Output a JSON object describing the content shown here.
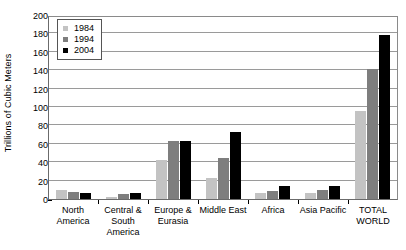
{
  "chart_data": {
    "type": "bar",
    "title": "",
    "xlabel": "",
    "ylabel": "Trillions of Cubic Meters",
    "ylim": [
      0,
      200
    ],
    "yticks": [
      0,
      20,
      40,
      60,
      80,
      100,
      120,
      140,
      160,
      180,
      200
    ],
    "grid": true,
    "legend_position": "top-left",
    "categories": [
      "North America",
      "Central & South America",
      "Europe & Eurasia",
      "Middle East",
      "Africa",
      "Asia Pacific",
      "TOTAL WORLD"
    ],
    "series": [
      {
        "name": "1984",
        "color": "#c3c3c3",
        "values": [
          10,
          2.5,
          42,
          23,
          6,
          6,
          96
        ]
      },
      {
        "name": "1994",
        "color": "#7e7e7e",
        "values": [
          8,
          5,
          63,
          45,
          9,
          10,
          141
        ]
      },
      {
        "name": "2004",
        "color": "#000000",
        "values": [
          7,
          6.5,
          63,
          73,
          14,
          14,
          178
        ]
      }
    ]
  },
  "axis": {
    "y_title": "Trillions of Cubic Meters",
    "y_labels": [
      "200",
      "180",
      "160",
      "140",
      "120",
      "100",
      "80",
      "60",
      "40",
      "20",
      "0"
    ],
    "x_labels": [
      "North America",
      "Central & South America",
      "Europe & Eurasia",
      "Middle East",
      "Africa",
      "Asia Pacific",
      "TOTAL WORLD"
    ]
  },
  "legend": {
    "items": [
      {
        "label": "1984",
        "color": "#c3c3c3"
      },
      {
        "label": "1994",
        "color": "#7e7e7e"
      },
      {
        "label": "2004",
        "color": "#000000"
      }
    ]
  }
}
